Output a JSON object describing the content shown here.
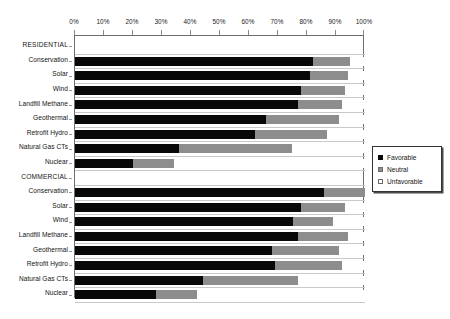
{
  "chart_data": {
    "type": "bar",
    "subtype": "stacked-horizontal-bar",
    "title": "",
    "xlabel": "",
    "ylabel": "",
    "xlim": [
      0,
      100
    ],
    "xtick_labels": [
      "0%",
      "10%",
      "20%",
      "30%",
      "40%",
      "50%",
      "60%",
      "70%",
      "80%",
      "90%",
      "100%"
    ],
    "xtick_values": [
      0,
      10,
      20,
      30,
      40,
      50,
      60,
      70,
      80,
      90,
      100
    ],
    "grid": false,
    "legend_position": "right",
    "series": [
      {
        "name": "Favorable",
        "color": "#080808"
      },
      {
        "name": "Neutral",
        "color": "#8d8d8d"
      },
      {
        "name": "Unfavorable",
        "color": "#ffffff"
      }
    ],
    "groups": [
      {
        "label": "RESIDENTIAL",
        "is_header": true,
        "categories": [
          {
            "label": "Conservation",
            "values": [
              82,
              13,
              5
            ]
          },
          {
            "label": "Solar",
            "values": [
              81,
              13,
              6
            ]
          },
          {
            "label": "Wind",
            "values": [
              78,
              15,
              7
            ]
          },
          {
            "label": "Landfill Methane",
            "values": [
              77,
              15,
              8
            ]
          },
          {
            "label": "Geothermal",
            "values": [
              66,
              25,
              9
            ]
          },
          {
            "label": "Retrofit Hydro",
            "values": [
              62,
              25,
              13
            ]
          },
          {
            "label": "Natural Gas CTs",
            "values": [
              36,
              39,
              25
            ]
          },
          {
            "label": "Nuclear",
            "values": [
              20,
              14,
              66
            ]
          }
        ]
      },
      {
        "label": "COMMERCIAL",
        "is_header": true,
        "categories": [
          {
            "label": "Conservation",
            "values": [
              86,
              14,
              0
            ]
          },
          {
            "label": "Solar",
            "values": [
              78,
              15,
              7
            ]
          },
          {
            "label": "Wind",
            "values": [
              75,
              14,
              11
            ]
          },
          {
            "label": "Landfill Methane",
            "values": [
              77,
              17,
              6
            ]
          },
          {
            "label": "Geothermal",
            "values": [
              68,
              23,
              9
            ]
          },
          {
            "label": "Retrofit Hydro",
            "values": [
              69,
              23,
              8
            ]
          },
          {
            "label": "Natural Gas CTs",
            "values": [
              44,
              33,
              23
            ]
          },
          {
            "label": "Nuclear",
            "values": [
              28,
              14,
              58
            ]
          }
        ]
      }
    ]
  },
  "legend": {
    "items": [
      {
        "label": "Favorable",
        "swatch": "fav"
      },
      {
        "label": "Neutral",
        "swatch": "neu"
      },
      {
        "label": "Unfavorable",
        "swatch": "unfav"
      }
    ]
  }
}
